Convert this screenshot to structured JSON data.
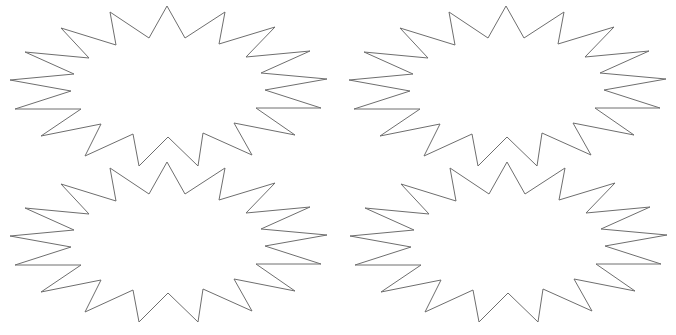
{
  "canvas": {
    "width": 676,
    "height": 335,
    "background": "#ffffff"
  },
  "style": {
    "stroke": "#6e6e6e",
    "fill": "#ffffff",
    "stroke_width": 1
  },
  "shape": {
    "type": "starburst",
    "points_count": 17,
    "base_points": [
      [
        167,
        6
      ],
      [
        185,
        38
      ],
      [
        225,
        12
      ],
      [
        219,
        44
      ],
      [
        275,
        27
      ],
      [
        246,
        57
      ],
      [
        310,
        51
      ],
      [
        261,
        73
      ],
      [
        327,
        79
      ],
      [
        265,
        90
      ],
      [
        321,
        108
      ],
      [
        256,
        108
      ],
      [
        295,
        135
      ],
      [
        234,
        123
      ],
      [
        252,
        155
      ],
      [
        203,
        133
      ],
      [
        198,
        166
      ],
      [
        168,
        137
      ],
      [
        139,
        166
      ],
      [
        133,
        134
      ],
      [
        85,
        156
      ],
      [
        101,
        124
      ],
      [
        41,
        136
      ],
      [
        81,
        109
      ],
      [
        15,
        109
      ],
      [
        71,
        91
      ],
      [
        10,
        80
      ],
      [
        74,
        74
      ],
      [
        25,
        52
      ],
      [
        89,
        58
      ],
      [
        61,
        28
      ],
      [
        116,
        45
      ],
      [
        110,
        12
      ],
      [
        149,
        38
      ]
    ]
  },
  "bursts": [
    {
      "name": "starburst-top-left",
      "dx": 0,
      "dy": 0
    },
    {
      "name": "starburst-top-right",
      "dx": 339,
      "dy": 0
    },
    {
      "name": "starburst-bottom-left",
      "dx": 0,
      "dy": 156
    },
    {
      "name": "starburst-bottom-right",
      "dx": 340,
      "dy": 156
    }
  ]
}
